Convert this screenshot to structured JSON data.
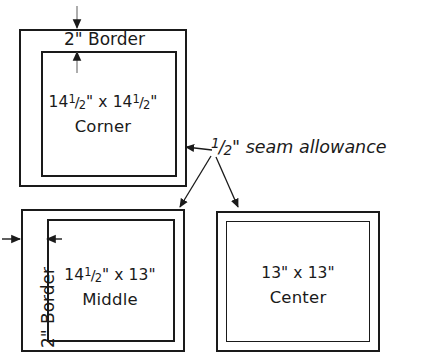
{
  "diagram": {
    "stroke_color": "#1a1a1a",
    "background_color": "#ffffff",
    "blocks": [
      {
        "id": "corner",
        "dimension_text": "14½\" x 14½\"",
        "dimension_parts": {
          "whole1": "14",
          "num": "1",
          "den": "2",
          "mid": "\" x ",
          "whole2": "14",
          "num2": "1",
          "den2": "2",
          "tail": "\""
        },
        "name": "Corner",
        "border_caption": "2\" Border",
        "border_caption_parts": {
          "value": "2",
          "unit": "\"",
          "word": "Border"
        },
        "border_orientation": "top"
      },
      {
        "id": "middle",
        "dimension_text": "14½\" x 13\"",
        "dimension_parts": {
          "whole1": "14",
          "num": "1",
          "den": "2",
          "mid": "\" x 13",
          "tail": "\""
        },
        "name": "Middle",
        "border_caption": "2\" Border",
        "border_caption_parts": {
          "value": "2",
          "unit": "\"",
          "word": "Border"
        },
        "border_orientation": "left"
      },
      {
        "id": "center",
        "dimension_text": "13\" x 13\"",
        "name": "Center",
        "border_caption": "",
        "border_orientation": "none"
      }
    ],
    "annotations": [
      {
        "id": "seam-allowance",
        "text": "½\" seam allowance",
        "text_parts": {
          "num": "1",
          "den": "2",
          "tail": "\" seam allowance"
        },
        "style": "italic",
        "targets": [
          "corner",
          "middle",
          "center"
        ],
        "arrow_count": 3
      },
      {
        "id": "corner-border-dimension",
        "type": "double-arrow",
        "orientation": "vertical",
        "measures": "2\" Border"
      },
      {
        "id": "middle-border-dimension",
        "type": "double-arrow",
        "orientation": "horizontal",
        "measures": "2\" Border"
      }
    ]
  }
}
